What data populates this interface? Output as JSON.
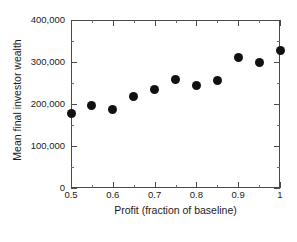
{
  "chart_data": {
    "type": "scatter",
    "title": "",
    "xlabel": "Profit (fraction of baseline)",
    "ylabel": "Mean final investor wealth",
    "x": [
      0.5,
      0.55,
      0.6,
      0.65,
      0.7,
      0.75,
      0.8,
      0.85,
      0.9,
      0.95,
      1.0
    ],
    "values": [
      178000,
      197000,
      188000,
      217000,
      234000,
      258000,
      245000,
      257000,
      311000,
      298000,
      327000
    ],
    "series": [
      {
        "name": "Mean final investor wealth",
        "values": [
          178000,
          197000,
          188000,
          217000,
          234000,
          258000,
          245000,
          257000,
          311000,
          298000,
          327000
        ]
      }
    ],
    "xlim": [
      0.5,
      1.0
    ],
    "ylim": [
      0,
      400000
    ],
    "xticks": [
      0.5,
      0.6,
      0.7,
      0.8,
      0.9,
      1.0
    ],
    "xticklabels": [
      "0.5",
      "0.6",
      "0.7",
      "0.8",
      "0.9",
      "1"
    ],
    "yticks": [
      0,
      100000,
      200000,
      300000,
      400000
    ],
    "yticklabels": [
      "0",
      "100,000",
      "200,000",
      "300,000",
      "400,000"
    ],
    "grid": false,
    "legend": false,
    "marker": "filled-circle",
    "marker_color": "#111111",
    "axis_color": "#4a4a4a",
    "background_color": "#ffffff"
  }
}
